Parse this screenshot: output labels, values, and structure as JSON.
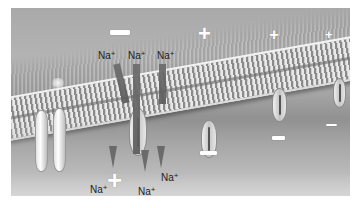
{
  "figure": {
    "colors": {
      "background": "#ffffff",
      "extracellular": "#adadad",
      "membrane": "#d9d9d9",
      "intracellular": "#c0c0c0",
      "signs": "#ffffff",
      "text": "#1e1e1e"
    },
    "top_labels": [
      {
        "ion": "Na",
        "charge": "+"
      },
      {
        "ion": "Na",
        "charge": "+"
      },
      {
        "ion": "Na",
        "charge": "+"
      }
    ],
    "bottom_labels": [
      {
        "ion": "Na",
        "charge": "+"
      },
      {
        "ion": "Na",
        "charge": "+"
      },
      {
        "ion": "Na",
        "charge": "+"
      }
    ],
    "signs": {
      "top_minus": "−",
      "top_plus": [
        "+",
        "+",
        "+"
      ],
      "bottom_plus": "+",
      "bottom_minus": [
        "−",
        "−",
        "−"
      ]
    }
  }
}
